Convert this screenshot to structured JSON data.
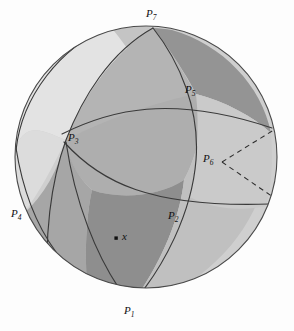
{
  "figure": {
    "canvas": {
      "width": 294,
      "height": 331,
      "background": "#fdfdfd"
    }
  },
  "sphere": {
    "center_x": 146,
    "center_y": 157,
    "radius": 131,
    "outline_color": "#4a4a4a",
    "outline_width": 1.1
  },
  "palette": {
    "lightest": "#e3e3e3",
    "light": "#cfcfcf",
    "mid_light": "#c4c4c4",
    "mid": "#b4b4b4",
    "mid_dark": "#a6a6a6",
    "dark": "#949494",
    "darkest": "#8a8a8a",
    "arc_stroke": "#3a3a3a",
    "dashed_stroke": "#2e2e2e",
    "point_fill": "#111111",
    "label_color": "#111111"
  },
  "points": [
    {
      "id": "P1",
      "letter": "P",
      "sub": "1",
      "label": "P1",
      "x": 131,
      "y": 305,
      "label_x": 125,
      "label_y": 306,
      "marker": false
    },
    {
      "id": "P2",
      "letter": "P",
      "sub": "2",
      "label": "P2",
      "x": 184,
      "y": 216,
      "label_x": 170,
      "label_y": 214,
      "marker": false
    },
    {
      "id": "P3",
      "letter": "P",
      "sub": "3",
      "label": "P3",
      "x": 66,
      "y": 140,
      "label_x": 69,
      "label_y": 136,
      "marker": false
    },
    {
      "id": "P4",
      "letter": "P",
      "sub": "4",
      "label": "P4",
      "x": 23,
      "y": 214,
      "label_x": 12,
      "label_y": 212,
      "marker": false
    },
    {
      "id": "P5",
      "letter": "P",
      "sub": "5",
      "label": "P5",
      "x": 196,
      "y": 94,
      "label_x": 188,
      "label_y": 88,
      "marker": false
    },
    {
      "id": "P6",
      "letter": "P",
      "sub": "6",
      "label": "P6",
      "x": 222,
      "y": 162,
      "label_x": 205,
      "label_y": 157,
      "marker": false
    },
    {
      "id": "P7",
      "letter": "P",
      "sub": "7",
      "label": "P7",
      "x": 153,
      "y": 28,
      "label_x": 146,
      "label_y": 12,
      "marker": false
    }
  ],
  "sample_point": {
    "id": "x",
    "label": "x",
    "x": 116,
    "y": 238,
    "label_x": 124,
    "label_y": 231,
    "marker": true,
    "marker_size": 3.2
  },
  "angle_marks": {
    "vertex": "P6",
    "vertex_x": 222,
    "vertex_y": 162,
    "style": "dashed",
    "dash_pattern": "5,4",
    "rays": [
      {
        "to_x": 276,
        "to_y": 130
      },
      {
        "to_x": 272,
        "to_y": 196
      }
    ]
  },
  "regions": [
    {
      "id": "region-top-left",
      "shade": "lightest",
      "hex": "#e3e3e3"
    },
    {
      "id": "region-top-mid",
      "shade": "mid_light",
      "hex": "#c4c4c4"
    },
    {
      "id": "region-top-right",
      "shade": "dark",
      "hex": "#949494"
    },
    {
      "id": "region-center",
      "shade": "mid",
      "hex": "#b4b4b4"
    },
    {
      "id": "region-left",
      "shade": "light",
      "hex": "#cfcfcf"
    },
    {
      "id": "region-lower-left",
      "shade": "mid_dark",
      "hex": "#a6a6a6"
    },
    {
      "id": "region-bottom",
      "shade": "darkest",
      "hex": "#8a8a8a"
    },
    {
      "id": "region-right",
      "shade": "light",
      "hex": "#cfcfcf"
    },
    {
      "id": "region-lower-right",
      "shade": "mid_light",
      "hex": "#c4c4c4"
    }
  ]
}
